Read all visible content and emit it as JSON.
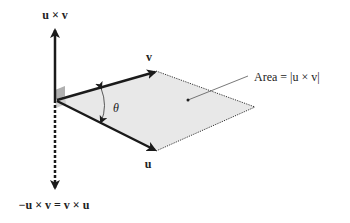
{
  "figure": {
    "labels": {
      "cross_up": "u × v",
      "cross_down": "−u × v = v × u",
      "v": "v",
      "u": "u",
      "theta": "θ",
      "area": "Area = |u × v|"
    },
    "colors": {
      "vector": "#1a1a1a",
      "parallelogram_fill": "#e6e6e6",
      "right_angle_marker": "#a8a8a8",
      "leader_line": "#555555"
    },
    "styles": {
      "up_arrow": "solid",
      "down_arrow": "dashed",
      "parallelogram_far_edges": "dotted"
    }
  }
}
